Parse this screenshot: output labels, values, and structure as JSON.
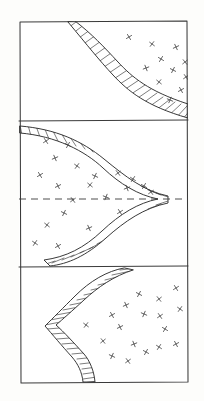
{
  "figure": {
    "background_color": "#fdfdfb",
    "ink_color": "#2e2e2e",
    "panel_count": 3
  },
  "frame": {
    "name": "outer-border",
    "x": 19,
    "y": 21,
    "width": 169,
    "height": 362,
    "stroke": "#3a3a3a"
  },
  "dividers": [
    {
      "name": "divider-top",
      "y": 121,
      "x1": 19,
      "x2": 188
    },
    {
      "name": "divider-bottom",
      "y": 267,
      "x1": 19,
      "x2": 188
    }
  ],
  "centerline": {
    "name": "dashed-centerline",
    "y": 199,
    "x1": 19,
    "x2": 188,
    "dash": "7 5"
  },
  "panels": [
    {
      "id": "panel-top",
      "label": "top-panel",
      "bounds": {
        "x": 19,
        "y": 21,
        "width": 169,
        "height": 100
      },
      "band": {
        "name": "hatched-band-top",
        "shape": "diagonal-s-curve",
        "entry_edge": "top",
        "entry_x": 75,
        "exit_edge": "right",
        "exit_y": 104,
        "hatch_count": 22
      },
      "blank_side": "left",
      "stipple_side": "right",
      "xmark_count": 11
    },
    {
      "id": "panel-middle",
      "label": "middle-panel",
      "bounds": {
        "x": 19,
        "y": 121,
        "width": 169,
        "height": 146
      },
      "band": {
        "name": "hatched-band-middle",
        "shape": "rightward-wedge",
        "entry_edge": "left-top",
        "entry_y": 126,
        "apex_x": 168,
        "apex_y": 199,
        "exit_edge": "bottom",
        "exit_x": 50,
        "hatch_count": 34
      },
      "blank_side": "right",
      "stipple_side": "left",
      "xmark_count": 21,
      "has_centerline": true
    },
    {
      "id": "panel-bottom",
      "label": "bottom-panel",
      "bounds": {
        "x": 19,
        "y": 267,
        "width": 169,
        "height": 116
      },
      "band": {
        "name": "hatched-band-bottom",
        "shape": "leftward-zigzag",
        "entry_edge": "top",
        "entry_x": 133,
        "notch_x": 56,
        "notch_y": 325,
        "exit_edge": "bottom",
        "exit_x": 95,
        "hatch_count": 26
      },
      "blank_side": "left",
      "stipple_side": "right",
      "xmark_count": 18
    }
  ],
  "xmarks": {
    "symbol": "x",
    "panel_top": [
      {
        "x": 129,
        "y": 37,
        "r": 14
      },
      {
        "x": 152,
        "y": 44,
        "r": -8
      },
      {
        "x": 176,
        "y": 47,
        "r": 20
      },
      {
        "x": 161,
        "y": 59,
        "r": -14
      },
      {
        "x": 185,
        "y": 62,
        "r": 6
      },
      {
        "x": 146,
        "y": 68,
        "r": 24
      },
      {
        "x": 173,
        "y": 70,
        "r": -18
      },
      {
        "x": 186,
        "y": 77,
        "r": 10
      },
      {
        "x": 159,
        "y": 82,
        "r": -6
      },
      {
        "x": 181,
        "y": 90,
        "r": 16
      },
      {
        "x": 170,
        "y": 100,
        "r": -22
      }
    ],
    "panel_middle": [
      {
        "x": 46,
        "y": 141,
        "r": 12
      },
      {
        "x": 68,
        "y": 145,
        "r": -16
      },
      {
        "x": 55,
        "y": 158,
        "r": 22
      },
      {
        "x": 77,
        "y": 166,
        "r": -9
      },
      {
        "x": 40,
        "y": 175,
        "r": 14
      },
      {
        "x": 95,
        "y": 176,
        "r": -20
      },
      {
        "x": 118,
        "y": 173,
        "r": 8
      },
      {
        "x": 133,
        "y": 179,
        "r": -12
      },
      {
        "x": 58,
        "y": 186,
        "r": 18
      },
      {
        "x": 90,
        "y": 185,
        "r": -6
      },
      {
        "x": 127,
        "y": 188,
        "r": 24
      },
      {
        "x": 144,
        "y": 186,
        "r": -15
      },
      {
        "x": 151,
        "y": 192,
        "r": 10
      },
      {
        "x": 64,
        "y": 213,
        "r": -19
      },
      {
        "x": 120,
        "y": 212,
        "r": 13
      },
      {
        "x": 47,
        "y": 225,
        "r": -7
      },
      {
        "x": 89,
        "y": 228,
        "r": 21
      },
      {
        "x": 35,
        "y": 243,
        "r": -11
      },
      {
        "x": 58,
        "y": 246,
        "r": 15
      },
      {
        "x": 106,
        "y": 197,
        "r": -23
      },
      {
        "x": 73,
        "y": 200,
        "r": 9
      }
    ],
    "panel_bottom": [
      {
        "x": 176,
        "y": 288,
        "r": 13
      },
      {
        "x": 139,
        "y": 294,
        "r": -17
      },
      {
        "x": 159,
        "y": 299,
        "r": 7
      },
      {
        "x": 126,
        "y": 305,
        "r": 21
      },
      {
        "x": 180,
        "y": 309,
        "r": -10
      },
      {
        "x": 112,
        "y": 315,
        "r": 16
      },
      {
        "x": 144,
        "y": 314,
        "r": -22
      },
      {
        "x": 160,
        "y": 316,
        "r": 11
      },
      {
        "x": 86,
        "y": 325,
        "r": -8
      },
      {
        "x": 120,
        "y": 327,
        "r": 19
      },
      {
        "x": 165,
        "y": 329,
        "r": -14
      },
      {
        "x": 103,
        "y": 341,
        "r": 6
      },
      {
        "x": 134,
        "y": 344,
        "r": 23
      },
      {
        "x": 159,
        "y": 347,
        "r": -12
      },
      {
        "x": 176,
        "y": 344,
        "r": 17
      },
      {
        "x": 112,
        "y": 356,
        "r": -20
      },
      {
        "x": 128,
        "y": 361,
        "r": 9
      },
      {
        "x": 146,
        "y": 352,
        "r": -16
      }
    ]
  }
}
